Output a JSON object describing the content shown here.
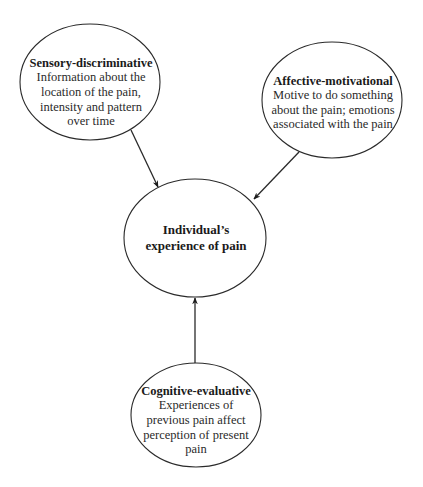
{
  "diagram": {
    "center": {
      "id": "experience",
      "lines": [
        "Individual’s",
        "experience of pain"
      ]
    },
    "nodes": [
      {
        "id": "sensory",
        "title": "Sensory-discriminative",
        "lines": [
          "Information about the",
          "location of the pain,",
          "intensity and pattern",
          "over time"
        ],
        "target": "experience"
      },
      {
        "id": "affective",
        "title": "Affective-motivational",
        "lines": [
          "Motive to do something",
          "about the pain; emotions",
          "associated with the pain"
        ],
        "target": "experience"
      },
      {
        "id": "cognitive",
        "title": "Cognitive-evaluative",
        "lines": [
          "Experiences of",
          "previous pain affect",
          "perception of present",
          "pain"
        ],
        "target": "experience"
      }
    ],
    "colors": {
      "stroke": "#2a2a2a",
      "text": "#1a1a1a",
      "background": "#ffffff"
    }
  }
}
